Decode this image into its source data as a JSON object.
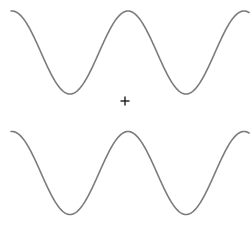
{
  "figure": {
    "width": 250,
    "height": 230,
    "background_color": "#ffffff"
  },
  "chart_data": {
    "type": "line",
    "title": "",
    "subtitle": "",
    "xlabel": "",
    "ylabel": "",
    "xlim": [
      0,
      250
    ],
    "ylim": [
      230,
      0
    ],
    "grid": false,
    "legend": null,
    "axes_visible": false,
    "tick_labels_x": [],
    "tick_labels_y": [],
    "annotations": [
      {
        "name": "fixation-cross",
        "symbol": "+",
        "x": 125,
        "y": 101,
        "size_px": 9,
        "color": "#1a1a1a"
      }
    ],
    "series": [
      {
        "name": "upper-sinusoid",
        "color": "#7c7c7c",
        "linewidth": 1.6,
        "waveform": "cosine",
        "amplitude": 41.5,
        "baseline_y": 52.5,
        "period_px": 116,
        "phase_deg": 0,
        "x_start": 11,
        "x_end": 249,
        "peaks": [
          {
            "x": 12,
            "y": 11
          },
          {
            "x": 130,
            "y": 11
          },
          {
            "x": 248,
            "y": 11
          }
        ],
        "troughs": [
          {
            "x": 72,
            "y": 94
          },
          {
            "x": 186,
            "y": 94
          }
        ]
      },
      {
        "name": "lower-sinusoid",
        "color": "#7c7c7c",
        "linewidth": 1.6,
        "waveform": "cosine",
        "amplitude": 41.5,
        "baseline_y": 173.0,
        "period_px": 116,
        "phase_deg": 0,
        "x_start": 11,
        "x_end": 249,
        "peaks": [
          {
            "x": 12,
            "y": 131
          },
          {
            "x": 130,
            "y": 131
          },
          {
            "x": 248,
            "y": 131
          }
        ],
        "troughs": [
          {
            "x": 72,
            "y": 215
          },
          {
            "x": 186,
            "y": 215
          }
        ]
      }
    ]
  },
  "elements": {
    "upper_wave_name": "upper-sinusoid",
    "lower_wave_name": "lower-sinusoid",
    "fixation_name": "fixation-cross"
  },
  "colors": {
    "stroke": "#7c7c7c",
    "marker": "#1a1a1a",
    "background": "#ffffff"
  }
}
